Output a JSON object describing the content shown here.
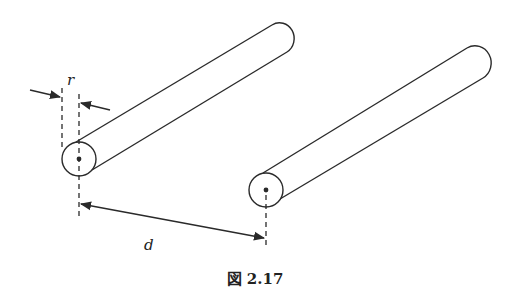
{
  "figure": {
    "caption": "図 2.17",
    "labels": {
      "radius": "r",
      "distance": "d"
    },
    "stroke_color": "#2a2a2a",
    "background": "#ffffff"
  }
}
